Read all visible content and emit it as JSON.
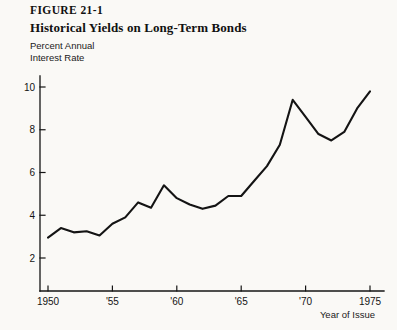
{
  "figure": {
    "label": "FIGURE 21-1",
    "title": "Historical Yields on Long-Term Bonds",
    "caption_line1": "Percent Annual",
    "caption_line2": "Interest Rate",
    "x_axis_title": "Year of Issue"
  },
  "colors": {
    "background": "#faf9f6",
    "ink": "#141414",
    "line": "#141414"
  },
  "chart_data": {
    "type": "line",
    "title": "Historical Yields on Long-Term Bonds",
    "subtitle": "FIGURE 21-1",
    "xlabel": "Year of Issue",
    "ylabel": "Percent Annual Interest Rate",
    "xlim": [
      1949,
      1976
    ],
    "ylim": [
      0,
      11
    ],
    "grid": false,
    "legend": false,
    "x_ticks": [
      1950,
      1955,
      1960,
      1965,
      1970,
      1975
    ],
    "x_tick_labels": [
      "1950",
      "'55",
      "'60",
      "'65",
      "'70",
      "1975"
    ],
    "y_ticks": [
      2,
      4,
      6,
      8,
      10
    ],
    "y_tick_labels": [
      "2",
      "4",
      "6",
      "8",
      "10"
    ],
    "series": [
      {
        "name": "Long-Term Bond Yield",
        "x": [
          1950,
          1951,
          1952,
          1953,
          1954,
          1955,
          1956,
          1957,
          1958,
          1959,
          1960,
          1961,
          1962,
          1963,
          1964,
          1965,
          1966,
          1967,
          1968,
          1969,
          1970,
          1971,
          1972,
          1973,
          1974,
          1975
        ],
        "values": [
          2.95,
          3.4,
          3.2,
          3.25,
          3.05,
          3.6,
          3.9,
          4.6,
          4.35,
          5.4,
          4.8,
          4.5,
          4.3,
          4.45,
          4.9,
          4.9,
          5.6,
          6.3,
          7.3,
          9.4,
          8.6,
          7.8,
          7.5,
          7.9,
          9.0,
          9.8
        ]
      }
    ]
  }
}
